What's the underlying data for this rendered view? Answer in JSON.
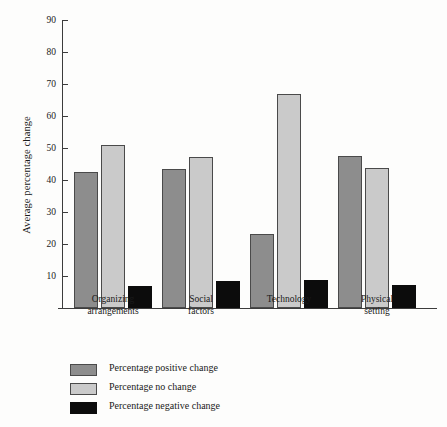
{
  "chart_data": {
    "type": "bar",
    "title": "",
    "xlabel": "",
    "ylabel": "Average percentage change",
    "categories": [
      "Organizing\narrangements",
      "Social\nfactors",
      "Technology",
      "Physical\nsetting"
    ],
    "series": [
      {
        "name": "Percentage positive change",
        "color": "#8d8d8d",
        "values": [
          42.4,
          43.4,
          23.1,
          47.5
        ]
      },
      {
        "name": "Percentage no change",
        "color": "#cacaca",
        "values": [
          50.9,
          47.2,
          66.9,
          43.8
        ]
      },
      {
        "name": "Percentage negative change",
        "color": "#0c0c0c",
        "values": [
          6.9,
          8.4,
          8.9,
          7.2
        ]
      }
    ],
    "yticks": [
      10,
      20,
      30,
      40,
      50,
      60,
      70,
      80,
      90
    ],
    "ylim": [
      0,
      90
    ],
    "grid": false,
    "legend_position": "below-axes",
    "legend_entries": [
      "Percentage positive change",
      "Percentage no change",
      "Percentage negative change"
    ]
  },
  "axis": {
    "y_title": "Average percentage change",
    "tick_labels": [
      "90",
      "80",
      "70",
      "60",
      "50",
      "40",
      "30",
      "20",
      "10"
    ]
  },
  "categories": [
    {
      "label": "Organizing\narrangements"
    },
    {
      "label": "Social\nfactors"
    },
    {
      "label": "Technology"
    },
    {
      "label": "Physical\nsetting"
    }
  ],
  "legend": [
    {
      "label": "Percentage positive change",
      "swatch": "dark-gray"
    },
    {
      "label": "Percentage no change",
      "swatch": "light-gray"
    },
    {
      "label": "Percentage negative change",
      "swatch": "black"
    }
  ]
}
